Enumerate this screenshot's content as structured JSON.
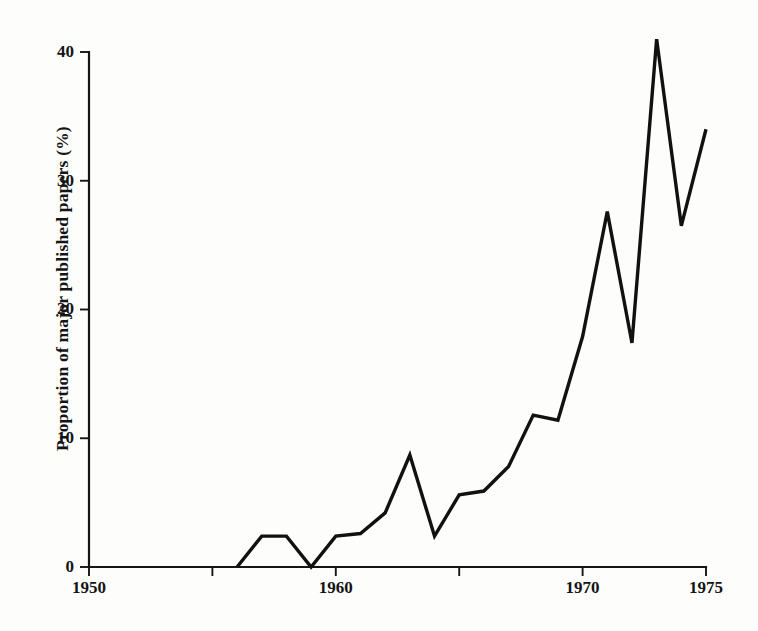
{
  "chart_data": {
    "type": "line",
    "title": "",
    "subtitle": "",
    "xlabel": "",
    "ylabel": "Proportion of major published papers (%)",
    "xlim": [
      1950,
      1975
    ],
    "ylim": [
      0,
      40
    ],
    "grid": false,
    "legend": null,
    "x_ticks": [
      1950,
      1955,
      1960,
      1965,
      1970,
      1975
    ],
    "x_tick_labels": [
      "1950",
      "",
      "1960",
      "",
      "1970",
      "1975"
    ],
    "y_ticks": [
      0,
      10,
      20,
      30,
      40
    ],
    "y_tick_labels": [
      "0",
      "10",
      "20",
      "30",
      "40"
    ],
    "series": [
      {
        "name": "Proportion of major published papers",
        "color": "#111111",
        "x": [
          1956,
          1957,
          1958,
          1959,
          1960,
          1961,
          1962,
          1963,
          1964,
          1965,
          1966,
          1967,
          1968,
          1969,
          1970,
          1971,
          1972,
          1973,
          1974,
          1975
        ],
        "values": [
          0.0,
          2.4,
          2.4,
          0.0,
          2.4,
          2.6,
          4.2,
          8.7,
          2.4,
          5.6,
          5.9,
          7.8,
          11.8,
          11.4,
          17.9,
          27.6,
          17.4,
          41.0,
          26.5,
          34.0
        ]
      }
    ],
    "annotations": []
  },
  "axes": {
    "y_axis_name": "y-axis",
    "x_axis_name": "x-axis"
  }
}
